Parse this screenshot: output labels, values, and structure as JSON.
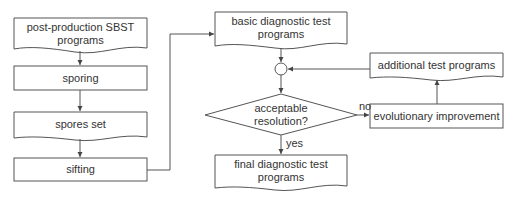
{
  "diagram": {
    "nodes": {
      "post_production": {
        "label": "post-production SBST programs",
        "line1": "post-production SBST",
        "line2": "programs",
        "shape": "document"
      },
      "sporing": {
        "label": "sporing",
        "shape": "process"
      },
      "spores_set": {
        "label": "spores set",
        "shape": "document"
      },
      "sifting": {
        "label": "sifting",
        "shape": "process"
      },
      "basic_diag": {
        "label": "basic diagnostic test programs",
        "line1": "basic diagnostic test",
        "line2": "programs",
        "shape": "document"
      },
      "junction": {
        "label": "",
        "shape": "circle"
      },
      "decision": {
        "label": "acceptable resolution?",
        "line1": "acceptable",
        "line2": "resolution?",
        "shape": "diamond"
      },
      "final_diag": {
        "label": "final diagnostic test programs",
        "line1": "final diagnostic test",
        "line2": "programs",
        "shape": "document"
      },
      "evolutionary": {
        "label": "evolutionary improvement",
        "shape": "process"
      },
      "additional": {
        "label": "additional test programs",
        "shape": "document"
      }
    },
    "edges": [
      {
        "from": "post_production",
        "to": "sporing",
        "label": ""
      },
      {
        "from": "sporing",
        "to": "spores_set",
        "label": ""
      },
      {
        "from": "spores_set",
        "to": "sifting",
        "label": ""
      },
      {
        "from": "sifting",
        "to": "basic_diag",
        "label": ""
      },
      {
        "from": "basic_diag",
        "to": "junction",
        "label": ""
      },
      {
        "from": "junction",
        "to": "decision",
        "label": ""
      },
      {
        "from": "decision",
        "to": "final_diag",
        "label": "yes"
      },
      {
        "from": "decision",
        "to": "evolutionary",
        "label": "no"
      },
      {
        "from": "evolutionary",
        "to": "additional",
        "label": ""
      },
      {
        "from": "additional",
        "to": "junction",
        "label": ""
      }
    ],
    "edge_labels": {
      "yes": "yes",
      "no": "no"
    },
    "colors": {
      "stroke": "#555555",
      "text": "#333333",
      "background": "#ffffff"
    }
  }
}
